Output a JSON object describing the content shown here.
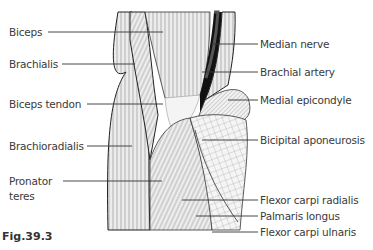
{
  "figure": {
    "caption": "Fig.39.3"
  },
  "labels_left": [
    {
      "id": "biceps",
      "text": "Biceps"
    },
    {
      "id": "brachialis",
      "text": "Brachialis"
    },
    {
      "id": "biceps-tendon",
      "text": "Biceps tendon"
    },
    {
      "id": "brachioradialis",
      "text": "Brachioradialis"
    },
    {
      "id": "pronator-teres-1",
      "text": "Pronator"
    },
    {
      "id": "pronator-teres-2",
      "text": "teres"
    }
  ],
  "labels_right": [
    {
      "id": "median-nerve",
      "text": "Median nerve"
    },
    {
      "id": "brachial-artery",
      "text": "Brachial artery"
    },
    {
      "id": "medial-epicondyle",
      "text": "Medial epicondyle"
    },
    {
      "id": "bicipital-aponeurosis",
      "text": "Bicipital aponeurosis"
    },
    {
      "id": "flexor-carpi-radialis",
      "text": "Flexor carpi radialis"
    },
    {
      "id": "palmaris-longus",
      "text": "Palmaris longus"
    },
    {
      "id": "flexor-carpi-ulnaris",
      "text": "Flexor carpi ulnaris"
    }
  ]
}
